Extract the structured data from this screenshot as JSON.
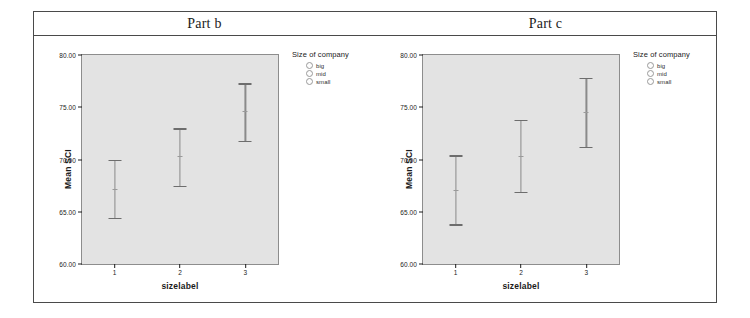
{
  "output": {
    "titles": [
      {
        "text": "Part b"
      },
      {
        "text": "Part c"
      }
    ]
  },
  "legend": {
    "title": "Size of company",
    "items": [
      {
        "label": "big"
      },
      {
        "label": "mid"
      },
      {
        "label": "small"
      }
    ]
  },
  "axes": {
    "ylabel": "Mean SCI",
    "xlabel": "sizelabel",
    "yticks": [
      "60.00",
      "65.00",
      "70.00",
      "75.00",
      "80.00"
    ],
    "xticks": [
      "1",
      "2",
      "3"
    ]
  },
  "chart_data": [
    {
      "type": "line",
      "title": "Part b",
      "xlabel": "sizelabel",
      "ylabel": "Mean SCI",
      "ylim": [
        60.0,
        80.0
      ],
      "ytick_values": [
        60.0,
        65.0,
        70.0,
        75.0,
        80.0
      ],
      "categories": [
        "1",
        "2",
        "3"
      ],
      "grid": false,
      "legend_position": "right",
      "legend_title": "Size of company",
      "legend_entries": [
        "big",
        "mid",
        "small"
      ],
      "series": [
        {
          "name": "Mean SCI",
          "values": [
            67.2,
            70.3,
            74.6
          ],
          "error_low": [
            64.4,
            67.5,
            71.8
          ],
          "error_high": [
            70.0,
            73.0,
            77.3
          ]
        }
      ]
    },
    {
      "type": "line",
      "title": "Part c",
      "xlabel": "sizelabel",
      "ylabel": "Mean SCI",
      "ylim": [
        60.0,
        80.0
      ],
      "ytick_values": [
        60.0,
        65.0,
        70.0,
        75.0,
        80.0
      ],
      "categories": [
        "1",
        "2",
        "3"
      ],
      "grid": false,
      "legend_position": "right",
      "legend_title": "Size of company",
      "legend_entries": [
        "big",
        "mid",
        "small"
      ],
      "series": [
        {
          "name": "Mean SCI",
          "values": [
            67.1,
            70.3,
            74.5
          ],
          "error_low": [
            63.8,
            66.9,
            71.2
          ],
          "error_high": [
            70.4,
            73.8,
            77.8
          ]
        }
      ]
    }
  ]
}
